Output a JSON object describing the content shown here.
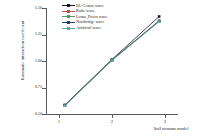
{
  "chart_data": {
    "type": "line",
    "title": "",
    "xlabel": "Soil stratum model",
    "ylabel": "Kinematic interaction coefficient",
    "categories": [
      "1",
      "2",
      "3"
    ],
    "x": [
      1,
      2,
      3
    ],
    "xlim": [
      0.6,
      3.4
    ],
    "ylim": [
      0.5,
      1.5
    ],
    "yticks": [
      "0.50",
      "0.75",
      "1.00",
      "1.25",
      "1.50"
    ],
    "ytick_values": [
      0.5,
      0.75,
      1.0,
      1.25,
      1.5
    ],
    "xticks": [
      "1",
      "2",
      "3"
    ],
    "grid": false,
    "legend_position": "top-center",
    "series": [
      {
        "name": "EL-Centro wave",
        "values": [
          0.585,
          1.015,
          1.42
        ],
        "color": "#1a1a1a",
        "marker": "square"
      },
      {
        "name": "Kobe wave",
        "values": [
          0.582,
          1.01,
          1.38
        ],
        "color": "#c0504d",
        "marker": "square"
      },
      {
        "name": "Loma_Prieta wave",
        "values": [
          0.58,
          1.012,
          1.375
        ],
        "color": "#4e9a62",
        "marker": "square"
      },
      {
        "name": "Northridge wave",
        "values": [
          0.583,
          1.008,
          1.378
        ],
        "color": "#2e3a6b",
        "marker": "square"
      },
      {
        "name": "Artificial wave",
        "values": [
          0.578,
          1.005,
          1.372
        ],
        "color": "#5fa8a0",
        "marker": "square"
      }
    ]
  },
  "axes": {
    "ytick_0": "0.50",
    "ytick_1": "0.75",
    "ytick_2": "1.00",
    "ytick_3": "1.25",
    "ytick_4": "1.50",
    "xtick_0": "1",
    "xtick_1": "2",
    "xtick_2": "3",
    "xlabel": "Soil stratum model",
    "ylabel": "Kinematic interaction coefficient"
  },
  "legend": {
    "item_0": "EL-Centro wave",
    "item_1": "Kobe wave",
    "item_2": "Loma_Prieta wave",
    "item_3": "Northridge wave",
    "item_4": "Artificial wave"
  }
}
